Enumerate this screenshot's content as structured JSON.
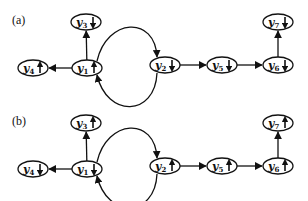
{
  "colors": {
    "stroke": "#111111",
    "background": "#ffffff"
  },
  "panels": [
    {
      "label": "(a)",
      "offset_y": 0,
      "nodes": [
        {
          "id": "y1",
          "name": "y",
          "sub": "1",
          "spin": "up",
          "cx": 87,
          "cy": 68
        },
        {
          "id": "y2",
          "name": "y",
          "sub": "2",
          "spin": "down",
          "cx": 165,
          "cy": 65
        },
        {
          "id": "y3",
          "name": "y",
          "sub": "3",
          "spin": "down",
          "cx": 86,
          "cy": 22
        },
        {
          "id": "y4",
          "name": "y",
          "sub": "4",
          "spin": "up",
          "cx": 33,
          "cy": 68
        },
        {
          "id": "y5",
          "name": "y",
          "sub": "5",
          "spin": "down",
          "cx": 222,
          "cy": 65
        },
        {
          "id": "y6",
          "name": "y",
          "sub": "6",
          "spin": "down",
          "cx": 278,
          "cy": 65
        },
        {
          "id": "y7",
          "name": "y",
          "sub": "7",
          "spin": "down",
          "cx": 278,
          "cy": 22
        }
      ]
    },
    {
      "label": "(b)",
      "offset_y": 101,
      "nodes": [
        {
          "id": "y1",
          "name": "y",
          "sub": "1",
          "spin": "down",
          "cx": 87,
          "cy": 68
        },
        {
          "id": "y2",
          "name": "y",
          "sub": "2",
          "spin": "up",
          "cx": 165,
          "cy": 65
        },
        {
          "id": "y3",
          "name": "y",
          "sub": "3",
          "spin": "up",
          "cx": 86,
          "cy": 22
        },
        {
          "id": "y4",
          "name": "y",
          "sub": "4",
          "spin": "down",
          "cx": 33,
          "cy": 68
        },
        {
          "id": "y5",
          "name": "y",
          "sub": "5",
          "spin": "up",
          "cx": 222,
          "cy": 65
        },
        {
          "id": "y6",
          "name": "y",
          "sub": "6",
          "spin": "up",
          "cx": 278,
          "cy": 65
        },
        {
          "id": "y7",
          "name": "y",
          "sub": "7",
          "spin": "up",
          "cx": 278,
          "cy": 22
        }
      ]
    }
  ],
  "edges": [
    {
      "from": "y1",
      "to": "y3",
      "type": "straight"
    },
    {
      "from": "y1",
      "to": "y4",
      "type": "straight"
    },
    {
      "from": "y1",
      "to": "y2",
      "type": "arc-top"
    },
    {
      "from": "y2",
      "to": "y1",
      "type": "arc-bottom"
    },
    {
      "from": "y2",
      "to": "y5",
      "type": "straight"
    },
    {
      "from": "y5",
      "to": "y6",
      "type": "straight"
    },
    {
      "from": "y6",
      "to": "y7",
      "type": "straight"
    }
  ]
}
